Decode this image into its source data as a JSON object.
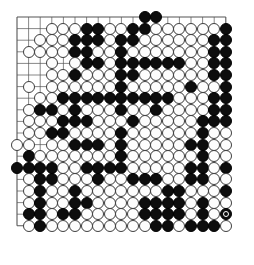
{
  "app": {
    "title": "Go Board Position",
    "board_type": "go-goban",
    "size_label": "19x19"
  },
  "board": {
    "size": 19,
    "line_color": "#555555",
    "star_point_color": "#333333",
    "black_stone_color": "#0d0d0d",
    "white_stone_color": "#fdfdfd",
    "white_stone_border": "#3a3a3a",
    "background_color": "#ffffff",
    "star_points": [
      [
        3,
        3
      ],
      [
        9,
        3
      ],
      [
        15,
        3
      ],
      [
        3,
        9
      ],
      [
        9,
        9
      ],
      [
        15,
        9
      ],
      [
        3,
        15
      ],
      [
        9,
        15
      ],
      [
        15,
        15
      ]
    ],
    "geometry": {
      "origin_x": 17,
      "origin_y": 17,
      "spacing": 11.6,
      "stone_diameter": 11.9
    },
    "legend": {
      "black": "Black stone",
      "white": "White stone",
      "empty": "Empty intersection",
      "marked": "Last move marker"
    },
    "rows": [
      ".........e.bb..........",
      "...wwwbbwwbbwwwwwwb",
      "..wwwbbbwbbwwwwwwbb",
      ".wwwwbbwwbwwwwwwwbb",
      "...w.wbbwbbbbbbwwbb",
      "...wwbwwwbbwwwwwwbb",
      ".w.wwwwwwbwwwwwbwwb",
      "..wwbbbbbbbbbbwwwbb",
      ".wbbwbwwwbwwbwwwwbb",
      ".wwwbbbwwwbwwwwwbbb",
      ".wwbbwwwwbwwwwwwbww",
      "ww.wwbbbwbwwwwwbbww",
      ".bwwwwwwwbwwwwwwbww",
      "bbbbwwbbbbwwwwwbbwb",
      ".wbbwwwbwwbbbwwbbww",
      ".wbwwbwwwwwwwbbwwwb",
      ".wbwwbbwwwwbbbbwbww",
      ".bbwbbwwwwwbbbbwbwB",
      ".wbwwwwwwwwwbbwbbbw"
    ],
    "marked_move": {
      "col": 19,
      "row": 18,
      "color": "black",
      "label": "last-move"
    },
    "stone_counts": {
      "black_label": "Black",
      "white_label": "White"
    }
  }
}
